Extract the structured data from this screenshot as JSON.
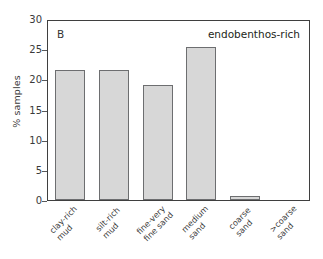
{
  "chart_data": {
    "type": "bar",
    "title": "",
    "panel_label": "B",
    "annotation": "endobenthos-rich",
    "xlabel": "",
    "ylabel": "% samples",
    "ylim": [
      0,
      30
    ],
    "yticks": [
      0,
      5,
      10,
      15,
      20,
      25,
      30
    ],
    "ytick_labels": [
      "0",
      "5",
      "10",
      "15",
      "20",
      "25",
      "30"
    ],
    "grid": false,
    "legend": "none",
    "categories": [
      "clay-rich mud",
      "silt-rich mud",
      "fine-very fine sand",
      "medium sand",
      "coarse sand",
      ">coarse sand"
    ],
    "category_lines": [
      [
        "clay-rich",
        "mud"
      ],
      [
        "silt-rich",
        "mud"
      ],
      [
        "fine-very",
        "fine sand"
      ],
      [
        "medium",
        "sand"
      ],
      [
        "coarse",
        "sand"
      ],
      [
        ">coarse",
        "sand"
      ]
    ],
    "values": [
      21.5,
      21.5,
      19.1,
      25.4,
      0.7,
      0
    ],
    "colors": {
      "bar_fill": "#d7d7d7",
      "bar_edge": "#6d6e70",
      "axis": "#3f3f3f",
      "text": "#3a3a3a",
      "background": "#ffffff"
    }
  }
}
